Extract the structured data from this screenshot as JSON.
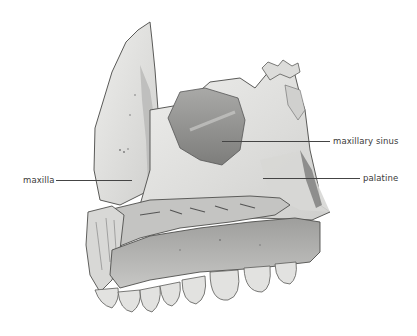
{
  "figure": {
    "labels": [
      {
        "id": "maxilla",
        "text": "maxilla",
        "x": 23,
        "y": 175,
        "line_from": [
          55,
          180
        ],
        "line_to": [
          130,
          180
        ]
      },
      {
        "id": "maxillary-sinus",
        "text": "maxillary sinus",
        "x": 333,
        "y": 136,
        "line_from": [
          222,
          141
        ],
        "line_to": [
          330,
          141
        ]
      },
      {
        "id": "palatine",
        "text": "palatine",
        "x": 363,
        "y": 173,
        "line_from": [
          263,
          178
        ],
        "line_to": [
          360,
          178
        ]
      }
    ]
  },
  "colors": {
    "background": "#ffffff",
    "bone_light": "#e6e6e4",
    "bone_mid": "#bdbdbb",
    "bone_dark": "#8a8a88",
    "outline": "#5a5a58",
    "label_text": "#3a3a3a",
    "leader_line": "#444444"
  }
}
